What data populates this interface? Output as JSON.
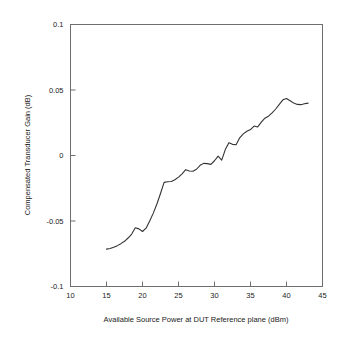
{
  "chart_data": {
    "type": "line",
    "title": "",
    "xlabel": "Available Source Power at DUT Reference plane (dBm)",
    "ylabel": "Compensated Transducer Gain (dB)",
    "xlim": [
      10,
      45
    ],
    "ylim": [
      -0.1,
      0.1
    ],
    "xticks": [
      10,
      15,
      20,
      25,
      30,
      35,
      40,
      45
    ],
    "xtick_labels": [
      "10",
      "15",
      "20",
      "25",
      "30",
      "35",
      "40",
      "45"
    ],
    "yticks": [
      -0.1,
      -0.05,
      0,
      0.05,
      0.1
    ],
    "ytick_labels": [
      "-0.1",
      "-0.05",
      "0",
      "0.05",
      "0.1"
    ],
    "grid": false,
    "legend": null,
    "line_color": "#333333",
    "series": [
      {
        "name": "Compensated Transducer Gain",
        "x": [
          15.0,
          15.5,
          16.0,
          16.5,
          17.0,
          17.5,
          18.0,
          18.5,
          19.0,
          19.5,
          20.0,
          20.5,
          21.0,
          21.5,
          22.0,
          22.5,
          23.0,
          23.5,
          24.0,
          24.5,
          25.0,
          25.5,
          26.0,
          26.5,
          27.0,
          27.5,
          28.0,
          28.5,
          29.0,
          29.5,
          30.0,
          30.5,
          31.0,
          31.5,
          32.0,
          32.5,
          33.0,
          33.5,
          34.0,
          34.5,
          35.0,
          35.5,
          36.0,
          36.5,
          37.0,
          37.5,
          38.0,
          38.5,
          39.0,
          39.5,
          40.0,
          40.5,
          41.0,
          41.5,
          42.0,
          42.5,
          43.0
        ],
        "y": [
          -0.0715,
          -0.071,
          -0.07,
          -0.0688,
          -0.0673,
          -0.0655,
          -0.063,
          -0.06,
          -0.0552,
          -0.056,
          -0.058,
          -0.0555,
          -0.05,
          -0.044,
          -0.037,
          -0.029,
          -0.0205,
          -0.02,
          -0.0198,
          -0.0185,
          -0.0165,
          -0.014,
          -0.0108,
          -0.0118,
          -0.012,
          -0.0105,
          -0.0075,
          -0.006,
          -0.0062,
          -0.0068,
          -0.004,
          -0.0005,
          -0.0035,
          0.0045,
          0.0098,
          0.0085,
          0.0082,
          0.0135,
          0.0165,
          0.0185,
          0.0198,
          0.0225,
          0.0218,
          0.0255,
          0.0285,
          0.03,
          0.0325,
          0.0355,
          0.039,
          0.0425,
          0.0435,
          0.0418,
          0.04,
          0.039,
          0.0388,
          0.0395,
          0.04
        ]
      }
    ]
  },
  "labels": {
    "xlabel": "Available Source Power at DUT Reference plane (dBm)",
    "ylabel": "Compensated Transducer Gain (dB)"
  }
}
